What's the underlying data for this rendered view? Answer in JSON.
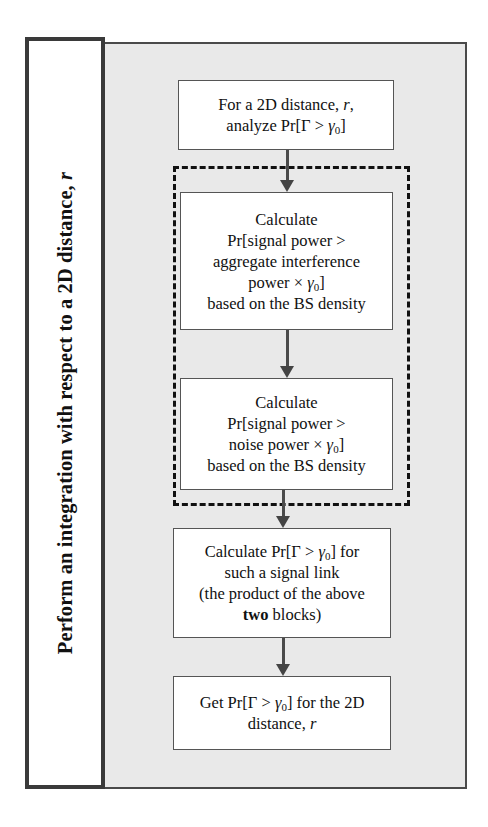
{
  "side_label": {
    "text": "Perform an integration with respect to a 2D distance, ",
    "var": "r"
  },
  "boxes": [
    {
      "id": "box-analyze",
      "lines": [
        "For a 2D distance, r,",
        "analyze Pr[Γ > γ0]"
      ]
    },
    {
      "id": "box-interference",
      "lines": [
        "Calculate",
        "Pr[signal power >",
        "aggregate interference",
        "power × γ0]",
        "based on the BS density"
      ]
    },
    {
      "id": "box-noise",
      "lines": [
        "Calculate",
        "Pr[signal power >",
        "noise power × γ0]",
        "based on the BS density"
      ]
    },
    {
      "id": "box-product",
      "lines": [
        "Calculate Pr[Γ > γ0] for",
        "such a signal link",
        "(the product of the above",
        "two blocks)"
      ]
    },
    {
      "id": "box-result",
      "lines": [
        "Get Pr[Γ > γ0] for the 2D",
        "distance, r"
      ]
    }
  ],
  "text": {
    "b1_l1a": "For a 2D distance, ",
    "b1_l1v": "r",
    "b1_l1b": ",",
    "b1_l2a": "analyze Pr[Γ > ",
    "b1_l2v": "γ",
    "b1_l2s": "0",
    "b1_l2b": "]",
    "b2_l1": "Calculate",
    "b2_l2": "Pr[signal power >",
    "b2_l3": "aggregate interference",
    "b2_l4a": "power × ",
    "b2_l4v": "γ",
    "b2_l4s": "0",
    "b2_l4b": "]",
    "b2_l5": "based on the BS density",
    "b3_l1": "Calculate",
    "b3_l2": "Pr[signal power >",
    "b3_l3a": "noise power × ",
    "b3_l3v": "γ",
    "b3_l3s": "0",
    "b3_l3b": "]",
    "b3_l4": "based on the BS density",
    "b4_l1a": "Calculate Pr[Γ > ",
    "b4_l1v": "γ",
    "b4_l1s": "0",
    "b4_l1b": "] for",
    "b4_l2": "such a signal link",
    "b4_l3": "(the product of the above",
    "b4_l4bold": "two",
    "b4_l4b": " blocks)",
    "b5_l1a": "Get Pr[Γ > ",
    "b5_l1v": "γ",
    "b5_l1s": "0",
    "b5_l1b": "] for the 2D",
    "b5_l2a": "distance, ",
    "b5_l2v": "r"
  },
  "colors": {
    "panel": "#e9e9e9",
    "border": "#3a3a3a",
    "box": "#ffffff",
    "arrow": "#444444"
  }
}
